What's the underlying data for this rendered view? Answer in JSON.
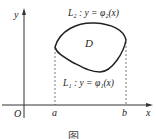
{
  "diagram": {
    "axes": {
      "x_label": "x",
      "y_label": "y",
      "origin_label": "O"
    },
    "points": {
      "a_label": "a",
      "b_label": "b"
    },
    "region_label": "D",
    "curves": {
      "upper": "L₂ : y = φ₂(x)",
      "lower": "L₁ : y = φ₁(x)"
    },
    "caption": "图"
  }
}
